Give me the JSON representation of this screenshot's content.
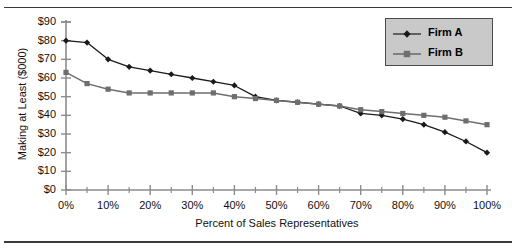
{
  "caption": {
    "clipped_top_text": ""
  },
  "chart_data": {
    "type": "line",
    "title": "",
    "xlabel": "Percent of Sales Representatives",
    "ylabel": "Making at Least ($000)",
    "xlim": [
      0,
      100
    ],
    "ylim": [
      0,
      90
    ],
    "grid": false,
    "legend_position": "top-right",
    "x_tick_labels": [
      "0%",
      "10%",
      "20%",
      "30%",
      "40%",
      "50%",
      "60%",
      "70%",
      "80%",
      "90%",
      "100%"
    ],
    "x_tick_values": [
      0,
      10,
      20,
      30,
      40,
      50,
      60,
      70,
      80,
      90,
      100
    ],
    "x_minor_tick_values": [
      5,
      15,
      25,
      35,
      45,
      55,
      65,
      75,
      85,
      95
    ],
    "y_tick_labels": [
      "$0",
      "$10",
      "$20",
      "$30",
      "$40",
      "$50",
      "$60",
      "$70",
      "$80",
      "$90"
    ],
    "y_tick_values": [
      0,
      10,
      20,
      30,
      40,
      50,
      60,
      70,
      80,
      90
    ],
    "x": [
      0,
      5,
      10,
      15,
      20,
      25,
      30,
      35,
      40,
      45,
      50,
      55,
      60,
      65,
      70,
      75,
      80,
      85,
      90,
      95,
      100
    ],
    "series": [
      {
        "name": "Firm A",
        "marker": "diamond",
        "color": "#1a1a1a",
        "values": [
          80,
          79,
          70,
          66,
          64,
          62,
          60,
          58,
          56,
          50,
          48,
          47,
          46,
          45,
          41,
          40,
          38,
          35,
          31,
          26,
          20
        ]
      },
      {
        "name": "Firm B",
        "marker": "square",
        "color": "#6e6e6e",
        "values": [
          63,
          57,
          54,
          52,
          52,
          52,
          52,
          52,
          50,
          49,
          48,
          47,
          46,
          45,
          43,
          42,
          41,
          40,
          39,
          37,
          35
        ]
      }
    ]
  },
  "legend": {
    "entries": [
      {
        "label": "Firm A"
      },
      {
        "label": "Firm B"
      }
    ]
  },
  "colors": {
    "series_a": "#1a1a1a",
    "series_b": "#6e6e6e",
    "axis": "#8c8c8c",
    "legend_bg": "#c9c9c9",
    "legend_border": "#4a4a4a",
    "plot_bg": "#ffffff"
  }
}
